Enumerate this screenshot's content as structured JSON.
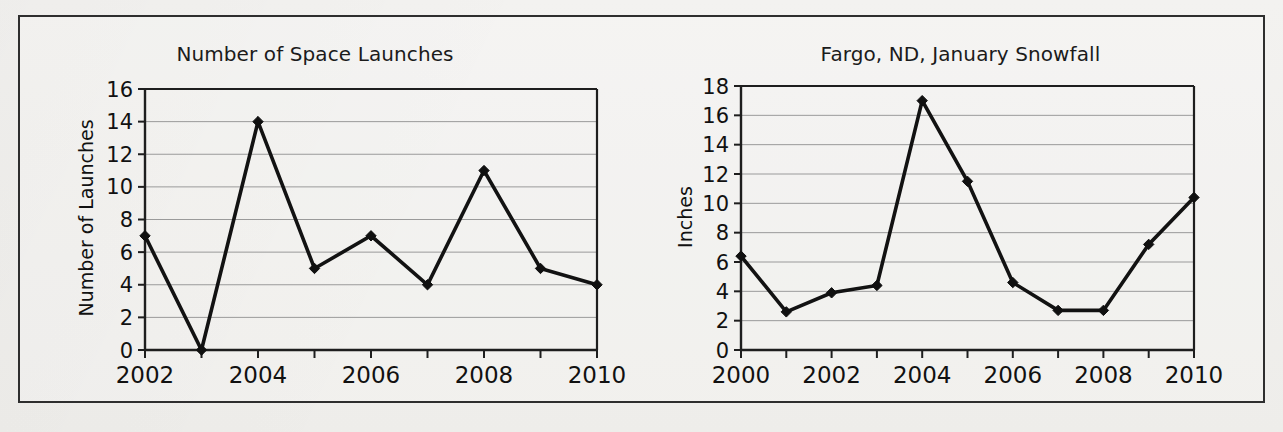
{
  "page": {
    "background_color": "#f2f1ef",
    "border_color": "#2e2e2e"
  },
  "chart_data": [
    {
      "id": "space-launches",
      "type": "line",
      "title": "Number of Space Launches",
      "xlabel": "",
      "ylabel": "Number of Launches",
      "x": [
        2002,
        2003,
        2004,
        2005,
        2006,
        2007,
        2008,
        2009,
        2010
      ],
      "values": [
        7,
        0,
        14,
        5,
        7,
        4,
        11,
        5,
        4
      ],
      "xlim": [
        2002,
        2010
      ],
      "ylim": [
        0,
        16
      ],
      "ytick_labels": [
        "0",
        "2",
        "4",
        "6",
        "8",
        "10",
        "12",
        "14",
        "16"
      ],
      "yticks": [
        0,
        2,
        4,
        6,
        8,
        10,
        12,
        14,
        16
      ],
      "xtick_labels": [
        "2002",
        "2004",
        "2006",
        "2008",
        "2010"
      ],
      "xticks": [
        2002,
        2004,
        2006,
        2008,
        2010
      ],
      "xtick_all": [
        2002,
        2003,
        2004,
        2005,
        2006,
        2007,
        2008,
        2009,
        2010
      ],
      "grid": true,
      "legend": "none",
      "marker": "diamond",
      "line_color": "#121212"
    },
    {
      "id": "fargo-snowfall",
      "type": "line",
      "title": "Fargo, ND, January Snowfall",
      "xlabel": "",
      "ylabel": "Inches",
      "x": [
        2000,
        2001,
        2002,
        2003,
        2004,
        2005,
        2006,
        2007,
        2008,
        2009,
        2010
      ],
      "values": [
        6.4,
        2.6,
        3.9,
        4.4,
        17.0,
        11.5,
        4.6,
        2.7,
        2.7,
        7.2,
        10.4
      ],
      "xlim": [
        2000,
        2010
      ],
      "ylim": [
        0,
        18
      ],
      "ytick_labels": [
        "0",
        "2",
        "4",
        "6",
        "8",
        "10",
        "12",
        "14",
        "16",
        "18"
      ],
      "yticks": [
        0,
        2,
        4,
        6,
        8,
        10,
        12,
        14,
        16,
        18
      ],
      "xtick_labels": [
        "2000",
        "2002",
        "2004",
        "2006",
        "2008",
        "2010"
      ],
      "xticks": [
        2000,
        2002,
        2004,
        2006,
        2008,
        2010
      ],
      "xtick_all": [
        2000,
        2001,
        2002,
        2003,
        2004,
        2005,
        2006,
        2007,
        2008,
        2009,
        2010
      ],
      "grid": true,
      "legend": "none",
      "marker": "diamond",
      "line_color": "#121212"
    }
  ]
}
